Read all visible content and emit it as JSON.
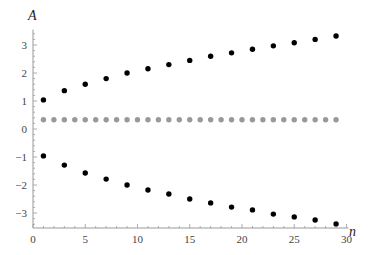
{
  "chart_data": {
    "type": "scatter",
    "title": "",
    "xlabel": "n",
    "ylabel": "A",
    "xlim": [
      0,
      30
    ],
    "ylim": [
      -3.4,
      3.6
    ],
    "grid": false,
    "legend": null,
    "x_ticks": [
      0,
      5,
      10,
      15,
      20,
      25,
      30
    ],
    "y_ticks": [
      -3,
      -2,
      -1,
      0,
      1,
      2,
      3
    ],
    "series": [
      {
        "name": "upper",
        "color": "#000000",
        "x": [
          1,
          3,
          5,
          7,
          9,
          11,
          13,
          15,
          17,
          19,
          21,
          23,
          25,
          27,
          29
        ],
        "values": [
          1.04,
          1.37,
          1.6,
          1.8,
          2.0,
          2.15,
          2.3,
          2.45,
          2.6,
          2.72,
          2.85,
          2.97,
          3.08,
          3.2,
          3.32
        ]
      },
      {
        "name": "constant",
        "color": "#999999",
        "x": [
          1,
          2,
          3,
          4,
          5,
          6,
          7,
          8,
          9,
          10,
          11,
          12,
          13,
          14,
          15,
          16,
          17,
          18,
          19,
          20,
          21,
          22,
          23,
          24,
          25,
          26,
          27,
          28,
          29
        ],
        "values": [
          0.33,
          0.33,
          0.33,
          0.33,
          0.33,
          0.33,
          0.33,
          0.33,
          0.33,
          0.33,
          0.33,
          0.33,
          0.33,
          0.33,
          0.33,
          0.33,
          0.33,
          0.33,
          0.33,
          0.33,
          0.33,
          0.33,
          0.33,
          0.33,
          0.33,
          0.33,
          0.33,
          0.33,
          0.33
        ]
      },
      {
        "name": "lower",
        "color": "#000000",
        "x": [
          1,
          3,
          5,
          7,
          9,
          11,
          13,
          15,
          17,
          19,
          21,
          23,
          25,
          27,
          29
        ],
        "values": [
          -0.96,
          -1.29,
          -1.57,
          -1.79,
          -2.0,
          -2.18,
          -2.32,
          -2.5,
          -2.64,
          -2.79,
          -2.89,
          -3.04,
          -3.14,
          -3.25,
          -3.39
        ]
      }
    ]
  }
}
